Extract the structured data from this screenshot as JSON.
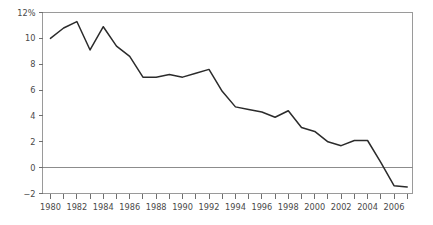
{
  "chart_data": {
    "type": "line",
    "title": "",
    "subtitle": "",
    "xlabel": "",
    "ylabel": "",
    "xlim": [
      1979.4,
      2007.4
    ],
    "ylim": [
      -2,
      12
    ],
    "grid": false,
    "legend": null,
    "zero_reference_line": true,
    "y_axis": {
      "tick_values": [
        -2,
        0,
        2,
        4,
        6,
        8,
        10,
        12
      ],
      "tick_labels": [
        "−2",
        "0",
        "2",
        "4",
        "6",
        "8",
        "10",
        "12%"
      ],
      "unit_suffix": "%"
    },
    "x_axis": {
      "tick_values": [
        1980,
        1981,
        1982,
        1983,
        1984,
        1985,
        1986,
        1987,
        1988,
        1989,
        1990,
        1991,
        1992,
        1993,
        1994,
        1995,
        1996,
        1997,
        1998,
        1999,
        2000,
        2001,
        2002,
        2003,
        2004,
        2005,
        2006,
        2007
      ],
      "labeled_values": [
        1980,
        1982,
        1984,
        1986,
        1988,
        1990,
        1992,
        1994,
        1996,
        1998,
        2000,
        2002,
        2004,
        2006
      ],
      "labels": [
        "1980",
        "1982",
        "1984",
        "1986",
        "1988",
        "1990",
        "1992",
        "1994",
        "1996",
        "1998",
        "2000",
        "2002",
        "2004",
        "2006"
      ]
    },
    "x": [
      1980,
      1981,
      1982,
      1983,
      1984,
      1985,
      1986,
      1987,
      1988,
      1989,
      1990,
      1991,
      1992,
      1993,
      1994,
      1995,
      1996,
      1997,
      1998,
      1999,
      2000,
      2001,
      2002,
      2003,
      2004,
      2005,
      2006,
      2007
    ],
    "values": [
      10.0,
      10.8,
      11.3,
      9.1,
      10.9,
      9.4,
      8.6,
      7.0,
      7.0,
      7.2,
      7.0,
      7.3,
      7.6,
      5.9,
      4.7,
      4.5,
      4.3,
      3.9,
      4.4,
      3.1,
      2.8,
      2.0,
      1.7,
      2.1,
      2.1,
      0.4,
      -1.4,
      -1.5
    ],
    "series": [
      {
        "name": "",
        "color": "#2b2b2b",
        "values": [
          10.0,
          10.8,
          11.3,
          9.1,
          10.9,
          9.4,
          8.6,
          7.0,
          7.0,
          7.2,
          7.0,
          7.3,
          7.6,
          5.9,
          4.7,
          4.5,
          4.3,
          3.9,
          4.4,
          3.1,
          2.8,
          2.0,
          1.7,
          2.1,
          2.1,
          0.4,
          -1.4,
          -1.5
        ]
      }
    ],
    "colors": {
      "series": "#2b2b2b",
      "frame": "#9a9a9a",
      "zero_line": "#8c8c8c",
      "tick": "#6f6f6f",
      "tick_label": "#4a4a4a",
      "background": "#ffffff"
    }
  }
}
